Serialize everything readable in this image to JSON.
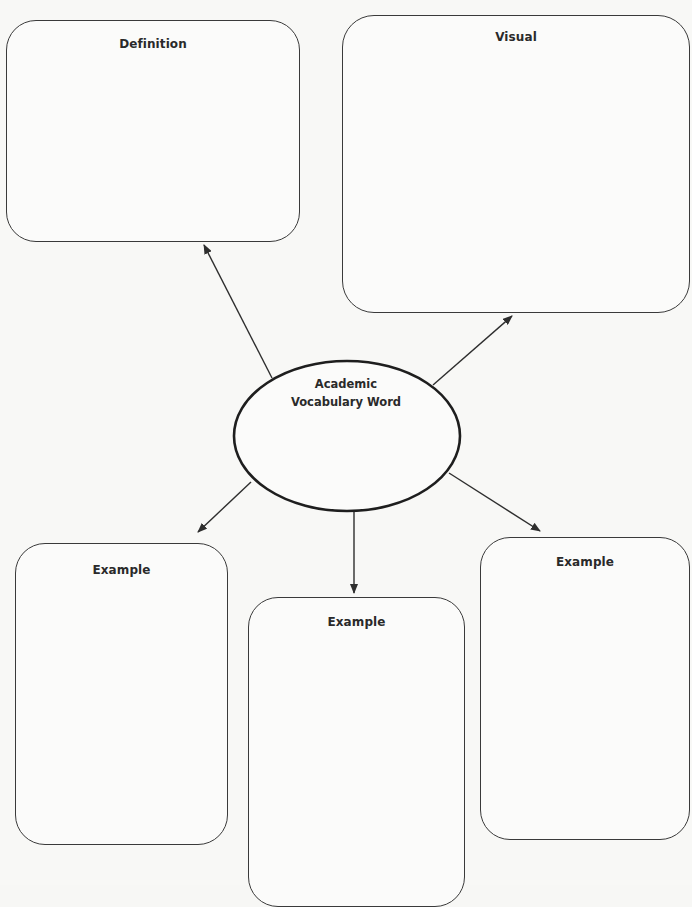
{
  "diagram": {
    "type": "graphic-organizer",
    "center": {
      "line1": "Academic",
      "line2": "Vocabulary Word"
    },
    "boxes": {
      "definition": {
        "title": "Definition"
      },
      "visual": {
        "title": "Visual"
      },
      "example1": {
        "title": "Example"
      },
      "example2": {
        "title": "Example"
      },
      "example3": {
        "title": "Example"
      }
    },
    "edges": [
      {
        "from": "center",
        "to": "definition"
      },
      {
        "from": "center",
        "to": "visual"
      },
      {
        "from": "center",
        "to": "example1"
      },
      {
        "from": "center",
        "to": "example2"
      },
      {
        "from": "center",
        "to": "example3"
      }
    ],
    "colors": {
      "stroke": "#2e2e2e",
      "background": "#f8f8f6"
    }
  }
}
